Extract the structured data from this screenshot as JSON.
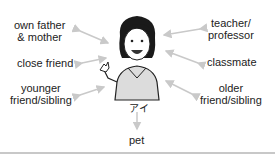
{
  "diagram": {
    "center": {
      "name": "アイ",
      "icon": "woman-waving-icon"
    },
    "relations": {
      "own_parents_line1": "own father",
      "own_parents_line2": "& mother",
      "close_friend": "close friend",
      "younger_line1": "younger",
      "younger_line2": "friend/sibling",
      "teacher_line1": "teacher/",
      "teacher_line2": "professor",
      "classmate": "classmate",
      "older_line1": "older",
      "older_line2": "friend/sibling",
      "pet": "pet"
    },
    "colors": {
      "arrow": "#c9c9c9",
      "text": "#222222",
      "rule": "#c8c8c8",
      "shirt": "#d9d9d9",
      "hair": "#1a1a1a"
    }
  }
}
